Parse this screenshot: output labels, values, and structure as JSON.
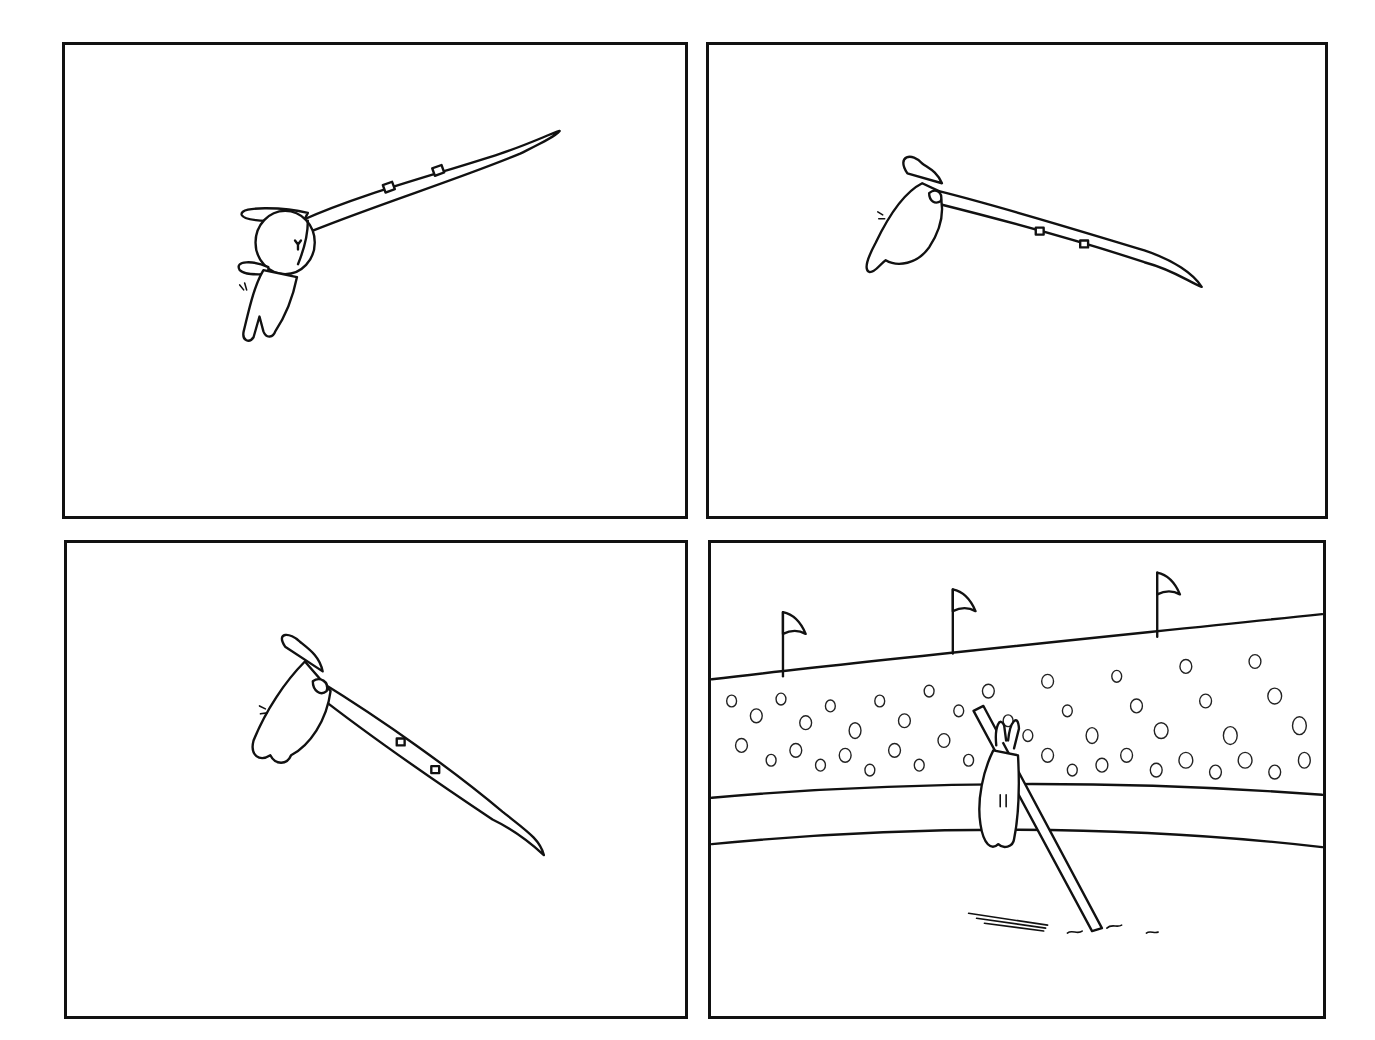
{
  "comic": {
    "panel_count": 4,
    "layout": "2x2 grid",
    "style": "black ink line art on white, wordless",
    "ink_color": "#111111",
    "background_color": "#ffffff",
    "panels": [
      {
        "index": 1,
        "scene": "rabbit hanging from bent vaulting pole, rising into the air",
        "text": ""
      },
      {
        "index": 2,
        "scene": "rabbit clinging to top of pole as it tips past vertical",
        "text": ""
      },
      {
        "index": 3,
        "scene": "rabbit upside down on pole swinging downward",
        "text": ""
      },
      {
        "index": 4,
        "scene": "stadium with flags and crowd; pole stuck in ground with rabbit hanging from it",
        "text": ""
      }
    ],
    "stadium": {
      "flag_count": 3
    }
  }
}
